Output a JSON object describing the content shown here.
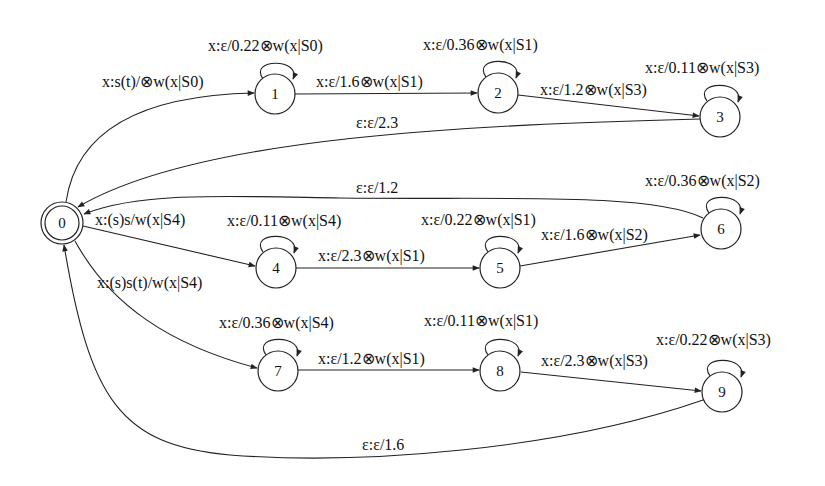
{
  "diagram": {
    "type": "weighted finite-state transducer",
    "nodes": [
      {
        "id": "0",
        "label": "0",
        "final": true
      },
      {
        "id": "1",
        "label": "1"
      },
      {
        "id": "2",
        "label": "2"
      },
      {
        "id": "3",
        "label": "3"
      },
      {
        "id": "4",
        "label": "4"
      },
      {
        "id": "5",
        "label": "5"
      },
      {
        "id": "6",
        "label": "6"
      },
      {
        "id": "7",
        "label": "7"
      },
      {
        "id": "8",
        "label": "8"
      },
      {
        "id": "9",
        "label": "9"
      }
    ],
    "edges": {
      "e0_1": {
        "from": "0",
        "to": "1",
        "label": "x:s(t)/⊗w(x|S0)"
      },
      "e1_1": {
        "from": "1",
        "to": "1",
        "label": "x:ε/0.22⊗w(x|S0)"
      },
      "e1_2": {
        "from": "1",
        "to": "2",
        "label": "x:ε/1.6⊗w(x|S1)"
      },
      "e2_2": {
        "from": "2",
        "to": "2",
        "label": "x:ε/0.36⊗w(x|S1)"
      },
      "e2_3": {
        "from": "2",
        "to": "3",
        "label": "x:ε/1.2⊗w(x|S3)"
      },
      "e3_3": {
        "from": "3",
        "to": "3",
        "label": "x:ε/0.11⊗w(x|S3)"
      },
      "e3_0": {
        "from": "3",
        "to": "0",
        "label": "ε:ε/2.3"
      },
      "e0_4": {
        "from": "0",
        "to": "4",
        "label": "x:(s)s/w(x|S4)"
      },
      "e4_4": {
        "from": "4",
        "to": "4",
        "label": "x:ε/0.11⊗w(x|S4)"
      },
      "e4_5": {
        "from": "4",
        "to": "5",
        "label": "x:ε/2.3⊗w(x|S1)"
      },
      "e5_5": {
        "from": "5",
        "to": "5",
        "label": "x:ε/0.22⊗w(x|S1)"
      },
      "e5_6": {
        "from": "5",
        "to": "6",
        "label": "x:ε/1.6⊗w(x|S2)"
      },
      "e6_6": {
        "from": "6",
        "to": "6",
        "label": "x:ε/0.36⊗w(x|S2)"
      },
      "e6_0": {
        "from": "6",
        "to": "0",
        "label": "ε:ε/1.2"
      },
      "e0_7": {
        "from": "0",
        "to": "7",
        "label": "x:(s)s(t)/w(x|S4)"
      },
      "e7_7": {
        "from": "7",
        "to": "7",
        "label": "x:ε/0.36⊗w(x|S4)"
      },
      "e7_8": {
        "from": "7",
        "to": "8",
        "label": "x:ε/1.2⊗w(x|S1)"
      },
      "e8_8": {
        "from": "8",
        "to": "8",
        "label": "x:ε/0.11⊗w(x|S1)"
      },
      "e8_9": {
        "from": "8",
        "to": "9",
        "label": "x:ε/2.3⊗w(x|S3)"
      },
      "e9_9": {
        "from": "9",
        "to": "9",
        "label": "x:ε/0.22⊗w(x|S3)"
      },
      "e9_0": {
        "from": "9",
        "to": "0",
        "label": "ε:ε/1.6"
      }
    }
  }
}
